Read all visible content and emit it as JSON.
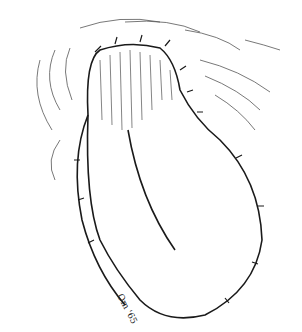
{
  "illustration": {
    "subject": "surgical flap sutured over finger-like projection",
    "signature": "Om '65",
    "colors": {
      "ink": "#1a1a1a",
      "background": "#ffffff"
    }
  }
}
